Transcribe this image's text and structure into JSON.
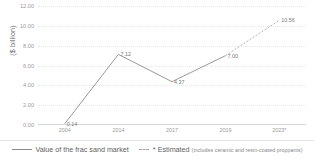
{
  "chart_data": {
    "type": "line",
    "title": "",
    "subtitle": "",
    "xlabel": "",
    "ylabel": "($ billion)",
    "ylim": [
      0,
      12
    ],
    "ytick_labels": [
      "12.00",
      "10.00",
      "8.00",
      "6.00",
      "4.00",
      "2.00",
      "0.00"
    ],
    "ytick_values": [
      12,
      10,
      8,
      6,
      4,
      2,
      0
    ],
    "grid": true,
    "grid_style": "dotted",
    "legend_position": "bottom",
    "categories": [
      "2004",
      "2014",
      "2017",
      "2019",
      "2023*"
    ],
    "values": [
      0.14,
      7.12,
      4.37,
      7.0,
      10.56
    ],
    "point_labels": [
      "0.14",
      "7.12",
      "4.37",
      "7.00",
      "10.56"
    ],
    "series": [
      {
        "name": "Value of the frac sand market",
        "x": [
          "2004",
          "2014",
          "2017",
          "2019"
        ],
        "values": [
          0.14,
          7.12,
          4.37,
          7.0
        ],
        "style": "solid"
      },
      {
        "name": "Estimated",
        "x": [
          "2019",
          "2023*"
        ],
        "values": [
          7.0,
          10.56
        ],
        "style": "dashed"
      }
    ],
    "colors": {
      "line": "#8c8c8c",
      "estimated_line": "#a8a8a8",
      "grid": "#e8e8e8",
      "text": "#808080",
      "background": "#ffffff"
    }
  },
  "legend": {
    "items": [
      {
        "label": "Value of the frac sand market",
        "marker": "solid-line"
      },
      {
        "label": "* Estimated ",
        "note": "(includes ceramic and resin-coated proppants)",
        "marker": "dashed-line"
      }
    ]
  }
}
